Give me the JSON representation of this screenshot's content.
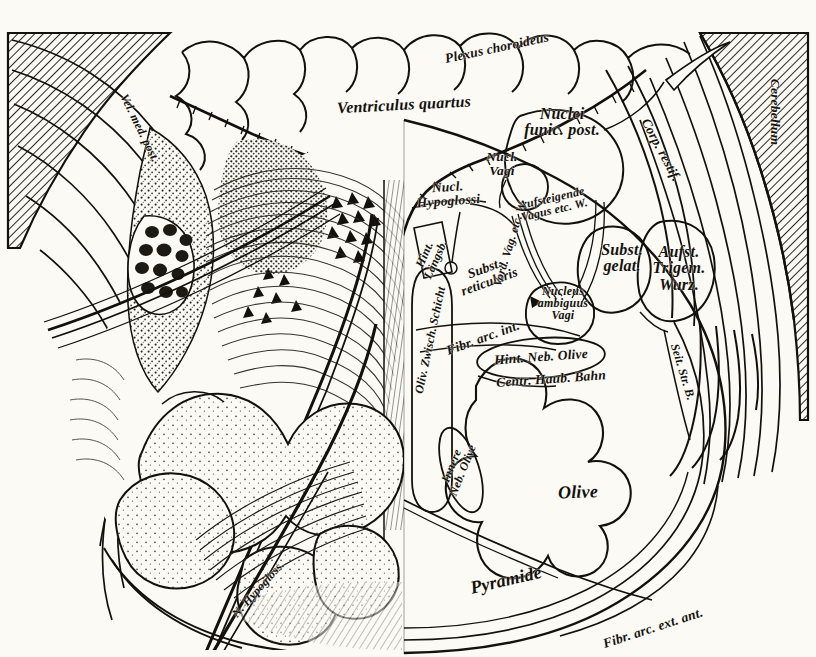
{
  "figure": {
    "background_color": "#fbfaf5",
    "ink_color": "#14110c",
    "width": 816,
    "height": 657
  },
  "labels": [
    {
      "name": "plexus-choroideus",
      "lines": [
        "Plexus choroideus"
      ],
      "x": 497,
      "y": 48,
      "rot": -12,
      "size": "md"
    },
    {
      "name": "ventriculus-quartus",
      "lines": [
        "Ventriculus quartus"
      ],
      "x": 404,
      "y": 105,
      "rot": -3,
      "size": "lg"
    },
    {
      "name": "vel-med-post",
      "lines": [
        "Vel. med. post."
      ],
      "x": 140,
      "y": 128,
      "rot": 64,
      "size": "sm"
    },
    {
      "name": "cerebellum",
      "lines": [
        "Cerebellum"
      ],
      "x": 775,
      "y": 112,
      "rot": 90,
      "size": "md"
    },
    {
      "name": "nuclei-funic-post",
      "lines": [
        "Nuclei",
        "funic. post."
      ],
      "x": 562,
      "y": 122,
      "rot": 0,
      "size": "lg"
    },
    {
      "name": "corp-restif",
      "lines": [
        "Corp. restif."
      ],
      "x": 661,
      "y": 150,
      "rot": 62,
      "size": "md"
    },
    {
      "name": "nucl-vagi",
      "lines": [
        "Nucl.",
        "Vagi"
      ],
      "x": 502,
      "y": 164,
      "rot": 0,
      "size": "md"
    },
    {
      "name": "nucl-hypoglossi",
      "lines": [
        "Nucl.",
        "Hypoglossi"
      ],
      "x": 448,
      "y": 194,
      "rot": -4,
      "size": "md"
    },
    {
      "name": "aufsteigende-vagus",
      "lines": [
        "Aufsteigende",
        "Vagus etc. W."
      ],
      "x": 553,
      "y": 204,
      "rot": -13,
      "size": "sm"
    },
    {
      "name": "hint-langsb",
      "lines": [
        "Hint.",
        "Längsb."
      ],
      "x": 430,
      "y": 257,
      "rot": -66,
      "size": "sm"
    },
    {
      "name": "subst-reticularis",
      "lines": [
        "Subst.",
        "reticularis"
      ],
      "x": 487,
      "y": 275,
      "rot": -20,
      "size": "md"
    },
    {
      "name": "vord-vag-etc-w",
      "lines": [
        "Vord. Vag. etc. W."
      ],
      "x": 510,
      "y": 243,
      "rot": -73,
      "size": "sm"
    },
    {
      "name": "subst-gelat",
      "lines": [
        "Subst.",
        "gelat."
      ],
      "x": 622,
      "y": 258,
      "rot": 0,
      "size": "lg"
    },
    {
      "name": "aufst-trigem-wurz",
      "lines": [
        "Aufst.",
        "Trigem.",
        "Wurz."
      ],
      "x": 679,
      "y": 268,
      "rot": 0,
      "size": "lg"
    },
    {
      "name": "nucleus-ambiguus-vagi",
      "lines": [
        "Nucleus",
        "ambiguus",
        "Vagi"
      ],
      "x": 563,
      "y": 303,
      "rot": 0,
      "size": "sm"
    },
    {
      "name": "oliv-zwisch-schicht",
      "lines": [
        "Oliv. Zwisch. Schicht"
      ],
      "x": 430,
      "y": 340,
      "rot": -78,
      "size": "sm"
    },
    {
      "name": "fibr-arc-int",
      "lines": [
        "Fibr. arc. int."
      ],
      "x": 483,
      "y": 338,
      "rot": -20,
      "size": "md"
    },
    {
      "name": "seit-str-b",
      "lines": [
        "Seit. Str. B."
      ],
      "x": 683,
      "y": 372,
      "rot": 73,
      "size": "sm"
    },
    {
      "name": "hint-neb-olive",
      "lines": [
        "Hint. Neb. Olive"
      ],
      "x": 541,
      "y": 357,
      "rot": -4,
      "size": "md"
    },
    {
      "name": "centr-haub-bahn",
      "lines": [
        "Centr. Haub. Bahn"
      ],
      "x": 551,
      "y": 379,
      "rot": -4,
      "size": "md"
    },
    {
      "name": "innere-neb-olive",
      "lines": [
        "Innere",
        "Neb. Olive"
      ],
      "x": 457,
      "y": 468,
      "rot": -68,
      "size": "sm"
    },
    {
      "name": "olive",
      "lines": [
        "Olive"
      ],
      "x": 578,
      "y": 492,
      "rot": -2,
      "size": "xl"
    },
    {
      "name": "n-hypogloss",
      "lines": [
        "N. Hypogloss."
      ],
      "x": 258,
      "y": 589,
      "rot": -48,
      "size": "sm"
    },
    {
      "name": "pyramide",
      "lines": [
        "Pyramide"
      ],
      "x": 506,
      "y": 580,
      "rot": -13,
      "size": "xl"
    },
    {
      "name": "fibr-arc-ext-ant",
      "lines": [
        "Fibr. arc. ext. ant."
      ],
      "x": 653,
      "y": 628,
      "rot": -18,
      "size": "md"
    }
  ]
}
